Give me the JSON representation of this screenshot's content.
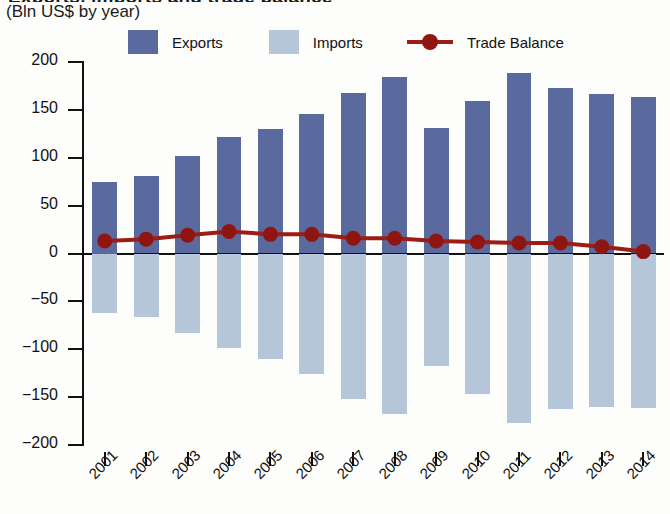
{
  "title_clipped": "Exports, imports and trade balance",
  "subtitle": "(Bln US$ by year)",
  "legend": {
    "exports": "Exports",
    "imports": "Imports",
    "balance": "Trade Balance"
  },
  "colors": {
    "exports": "#5a6a9e",
    "imports": "#b6c6da",
    "balance": "#9c1d15",
    "axis": "#111111",
    "background": "#fdfdfb"
  },
  "chart_data": {
    "type": "bar",
    "title": "Exports, imports and trade balance",
    "subtitle": "(Bln US$ by year)",
    "xlabel": "",
    "ylabel": "Bln US$ by year",
    "ylim": [
      -200,
      200
    ],
    "yticks": [
      200,
      150,
      100,
      50,
      0,
      -50,
      -100,
      -150,
      -200
    ],
    "ytick_labels": [
      "200",
      "150",
      "100",
      "50",
      "0",
      "−050",
      "−100",
      "−150",
      "−200"
    ],
    "grid": false,
    "legend_position": "top",
    "categories": [
      "2001",
      "2002",
      "2003",
      "2004",
      "2005",
      "2006",
      "2007",
      "2008",
      "2009",
      "2010",
      "2011",
      "2012",
      "2013",
      "2014"
    ],
    "series": [
      {
        "name": "Exports",
        "type": "bar",
        "color": "#5a6a9e",
        "values": [
          75,
          81,
          102,
          122,
          130,
          146,
          168,
          184,
          131,
          159,
          188,
          173,
          167,
          163
        ]
      },
      {
        "name": "Imports",
        "type": "bar",
        "color": "#b6c6da",
        "values": [
          -62,
          -66,
          -83,
          -99,
          -110,
          -126,
          -152,
          -168,
          -118,
          -147,
          -177,
          -162,
          -160,
          -161
        ]
      },
      {
        "name": "Trade Balance",
        "type": "line",
        "color": "#9c1d15",
        "values": [
          13,
          15,
          19,
          23,
          20,
          20,
          16,
          16,
          13,
          12,
          11,
          11,
          7,
          2
        ]
      }
    ]
  }
}
